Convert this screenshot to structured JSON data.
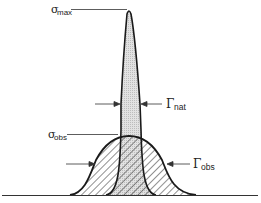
{
  "diagram": {
    "labels": {
      "sigma_max": {
        "symbol": "σ",
        "sub": "max"
      },
      "gamma_nat": {
        "symbol": "Γ",
        "sub": "nat"
      },
      "sigma_obs": {
        "symbol": "σ",
        "sub": "obs"
      },
      "gamma_obs": {
        "symbol": "Γ",
        "sub": "obs"
      }
    },
    "curves": [
      {
        "name": "natural-line-profile",
        "description": "narrow, tall peak, light gray fill"
      },
      {
        "name": "observed-line-profile",
        "description": "broad Gaussian, hatched fill"
      }
    ],
    "colors": {
      "stroke": "#1a1a1a",
      "narrow_fill": "#dcdcdc",
      "hatch": "#333333",
      "background": "#ffffff"
    }
  }
}
